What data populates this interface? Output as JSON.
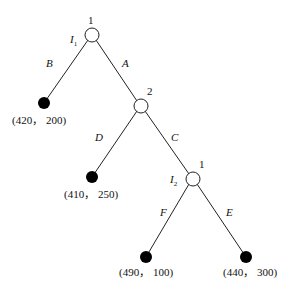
{
  "diagram": {
    "type": "extensive-form game tree",
    "nodes": [
      {
        "id": "root",
        "player": "1",
        "info_set": "I",
        "info_sub": "1"
      },
      {
        "id": "n2",
        "player": "2"
      },
      {
        "id": "n3",
        "player": "1",
        "info_set": "I",
        "info_sub": "2"
      }
    ],
    "actions": {
      "B": "B",
      "A": "A",
      "D": "D",
      "C": "C",
      "F": "F",
      "E": "E"
    },
    "payoffs": {
      "B": "(420， 200)",
      "D": "(410， 250)",
      "F": "(490， 100)",
      "E": "(440， 300)"
    }
  }
}
